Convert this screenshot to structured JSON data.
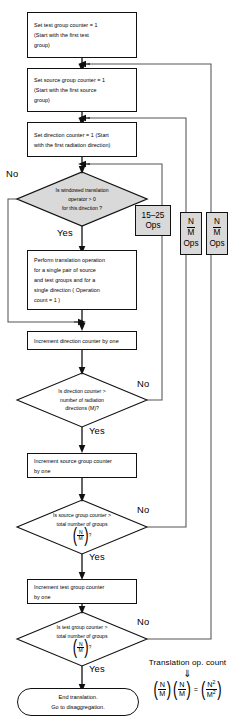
{
  "diagram": {
    "type": "flowchart"
  },
  "nodes": [
    {
      "id": "n1",
      "shape": "process",
      "lines": [
        "Set test group counter = 1",
        "(Start with the first test",
        "group)"
      ]
    },
    {
      "id": "n2",
      "shape": "process",
      "lines": [
        "Set source group counter = 1",
        "(Start with the first source",
        "group)"
      ]
    },
    {
      "id": "n3",
      "shape": "process",
      "lines": [
        "Set direction counter = 1 (Start",
        "with the first radiation direction)"
      ]
    },
    {
      "id": "d1",
      "shape": "decision",
      "lines": [
        "Is  windowed translation",
        "operator  >  0",
        "for this direction ?"
      ]
    },
    {
      "id": "n4",
      "shape": "process",
      "lines": [
        "Perform translation operation",
        "for a single pair of source",
        "and test groups and for a",
        "single direction ( Operation",
        "count = 1 )"
      ]
    },
    {
      "id": "n5",
      "shape": "process",
      "lines": [
        "Increment direction counter by one"
      ]
    },
    {
      "id": "d2",
      "shape": "decision",
      "lines": [
        "Is direction counter >",
        "number of radiation",
        "directions (M)?"
      ]
    },
    {
      "id": "n6",
      "shape": "process",
      "lines": [
        "Increment source group counter",
        "by one"
      ]
    },
    {
      "id": "d3",
      "shape": "decision",
      "lines": [
        "Is source group counter >",
        "total number of groups"
      ],
      "fraction": {
        "numerator": "N",
        "denominator": "M",
        "suffix": "?"
      }
    },
    {
      "id": "n7",
      "shape": "process",
      "lines": [
        "Increment test group counter",
        "by one"
      ]
    },
    {
      "id": "d4",
      "shape": "decision",
      "lines": [
        "Is test group counter >",
        "total number of groups"
      ],
      "fraction": {
        "numerator": "N",
        "denominator": "M",
        "suffix": "?"
      }
    },
    {
      "id": "end",
      "shape": "terminal",
      "lines": [
        "End translation.",
        "Go to disaggregation."
      ]
    }
  ],
  "branch_labels": {
    "d1_no": "No",
    "d1_yes": "Yes",
    "d2_no": "No",
    "d2_yes": "Yes",
    "d3_no": "No",
    "d3_yes": "Yes",
    "d4_no": "No",
    "d4_yes": "Yes"
  },
  "annotations": [
    {
      "id": "a1",
      "line1": "15–25",
      "line2": "Ops"
    },
    {
      "id": "a2",
      "numerator": "N",
      "denominator": "M",
      "label": "Ops"
    },
    {
      "id": "a3",
      "numerator": "N",
      "denominator": "M",
      "label": "Ops"
    }
  ],
  "formula": {
    "title": "Translation op. count",
    "arrow": "⇓",
    "term1": {
      "numerator": "N",
      "denominator": "M"
    },
    "term2": {
      "numerator": "N",
      "denominator": "M"
    },
    "equals": "=",
    "result": {
      "numerator": "N",
      "numerator_sup": "2",
      "denominator": "M",
      "denominator_sup": "2"
    }
  },
  "colors": {
    "stroke": "#111111",
    "decision_fill": "#d9d9d9",
    "annotation_fill": "#d9d9d9",
    "background": "#ffffff",
    "loop_line": "#555555"
  }
}
